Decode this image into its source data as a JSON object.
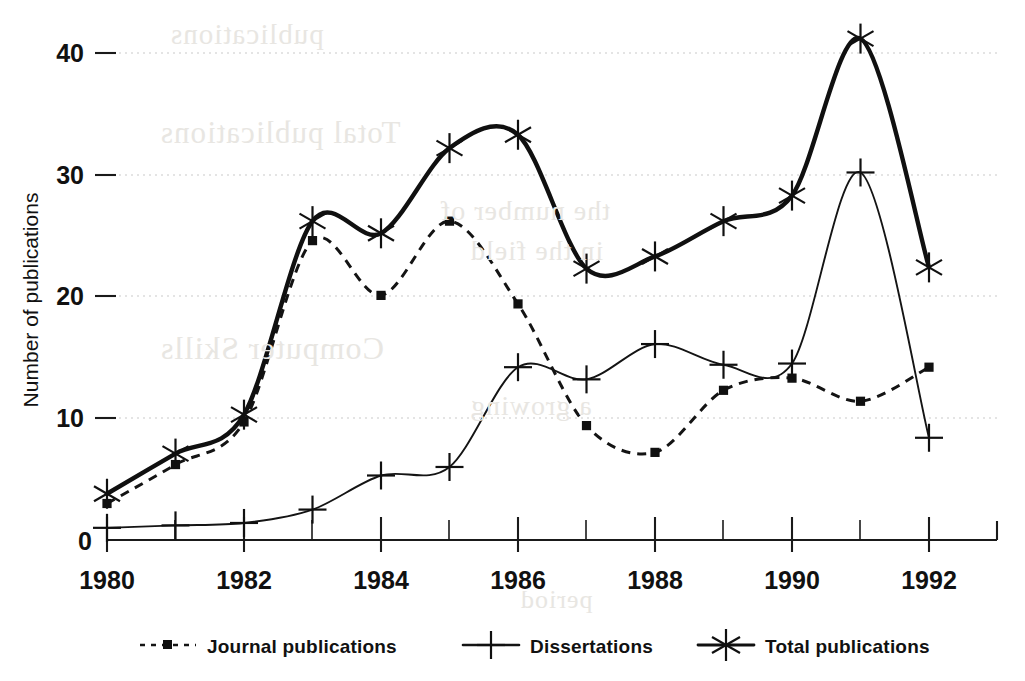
{
  "chart_data": {
    "type": "line",
    "title": "",
    "xlabel": "",
    "ylabel": "Number of publications",
    "x": [
      1980,
      1981,
      1982,
      1983,
      1984,
      1985,
      1986,
      1987,
      1988,
      1989,
      1990,
      1991,
      1992
    ],
    "xticks_major": [
      "1980",
      "1982",
      "1984",
      "1986",
      "1988",
      "1990",
      "1992"
    ],
    "xlim": [
      1980,
      1992.95
    ],
    "ylim": [
      0,
      41.5
    ],
    "yticks": [
      "0",
      "10",
      "20",
      "30",
      "40"
    ],
    "grid": "horizontal-dotted",
    "legend_position": "below-axes",
    "series": [
      {
        "name": "Journal publications",
        "marker": "square",
        "line": "dotted",
        "values": [
          3.0,
          6.2,
          9.7,
          24.6,
          20.1,
          26.2,
          19.4,
          9.4,
          7.2,
          12.3,
          13.3,
          11.4,
          14.2
        ]
      },
      {
        "name": "Dissertations",
        "marker": "plus",
        "line": "solid-thin",
        "values": [
          1.0,
          1.2,
          1.4,
          2.5,
          5.3,
          6.0,
          14.2,
          13.2,
          16.1,
          14.4,
          14.5,
          30.2,
          8.4
        ]
      },
      {
        "name": "Total publications",
        "marker": "asterisk",
        "line": "solid-thick",
        "values": [
          3.8,
          7.1,
          10.3,
          26.2,
          25.2,
          32.2,
          33.3,
          22.3,
          23.3,
          26.2,
          28.3,
          41.2,
          22.4
        ]
      }
    ]
  },
  "axes": {
    "y_title": "Number of publications",
    "y_ticks": [
      {
        "label": "40",
        "value": 40
      },
      {
        "label": "30",
        "value": 30
      },
      {
        "label": "20",
        "value": 20
      },
      {
        "label": "10",
        "value": 10
      },
      {
        "label": "0",
        "value": 0
      }
    ],
    "x_ticks": [
      {
        "label": "1980",
        "value": 1980
      },
      {
        "label": "1982",
        "value": 1982
      },
      {
        "label": "1984",
        "value": 1984
      },
      {
        "label": "1986",
        "value": 1986
      },
      {
        "label": "1988",
        "value": 1988
      },
      {
        "label": "1990",
        "value": 1990
      },
      {
        "label": "1992",
        "value": 1992
      }
    ]
  },
  "legend": {
    "items": [
      {
        "label": "Journal publications",
        "marker": "square",
        "style": "dotted"
      },
      {
        "label": "Dissertations",
        "marker": "plus",
        "style": "solid"
      },
      {
        "label": "Total publications",
        "marker": "asterisk",
        "style": "solid"
      }
    ]
  },
  "colors": {
    "ink": "#101010",
    "grid": "#c9c9c9",
    "paper": "#ffffff"
  },
  "bleed_through": [
    "publications",
    "Total publications",
    "the number of",
    "in the field",
    "Computer Skills",
    "a growing",
    "period"
  ]
}
